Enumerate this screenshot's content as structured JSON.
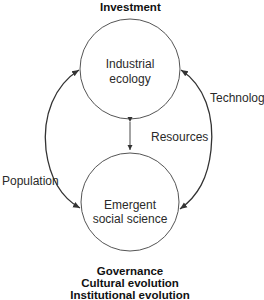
{
  "diagram": {
    "top_label": "Investment",
    "top_node": {
      "line1": "Industrial",
      "line2": "ecology"
    },
    "bottom_node": {
      "line1": "Emergent",
      "line2": "social science"
    },
    "left_arrow_label": "Population",
    "right_arrow_label": "Technology",
    "middle_arrow_label": "Resources",
    "bottom_labels": [
      "Governance",
      "Cultural evolution",
      "Institutional evolution"
    ],
    "colors": {
      "stroke": "#333333",
      "circle": "#555555",
      "text": "#222222"
    }
  }
}
